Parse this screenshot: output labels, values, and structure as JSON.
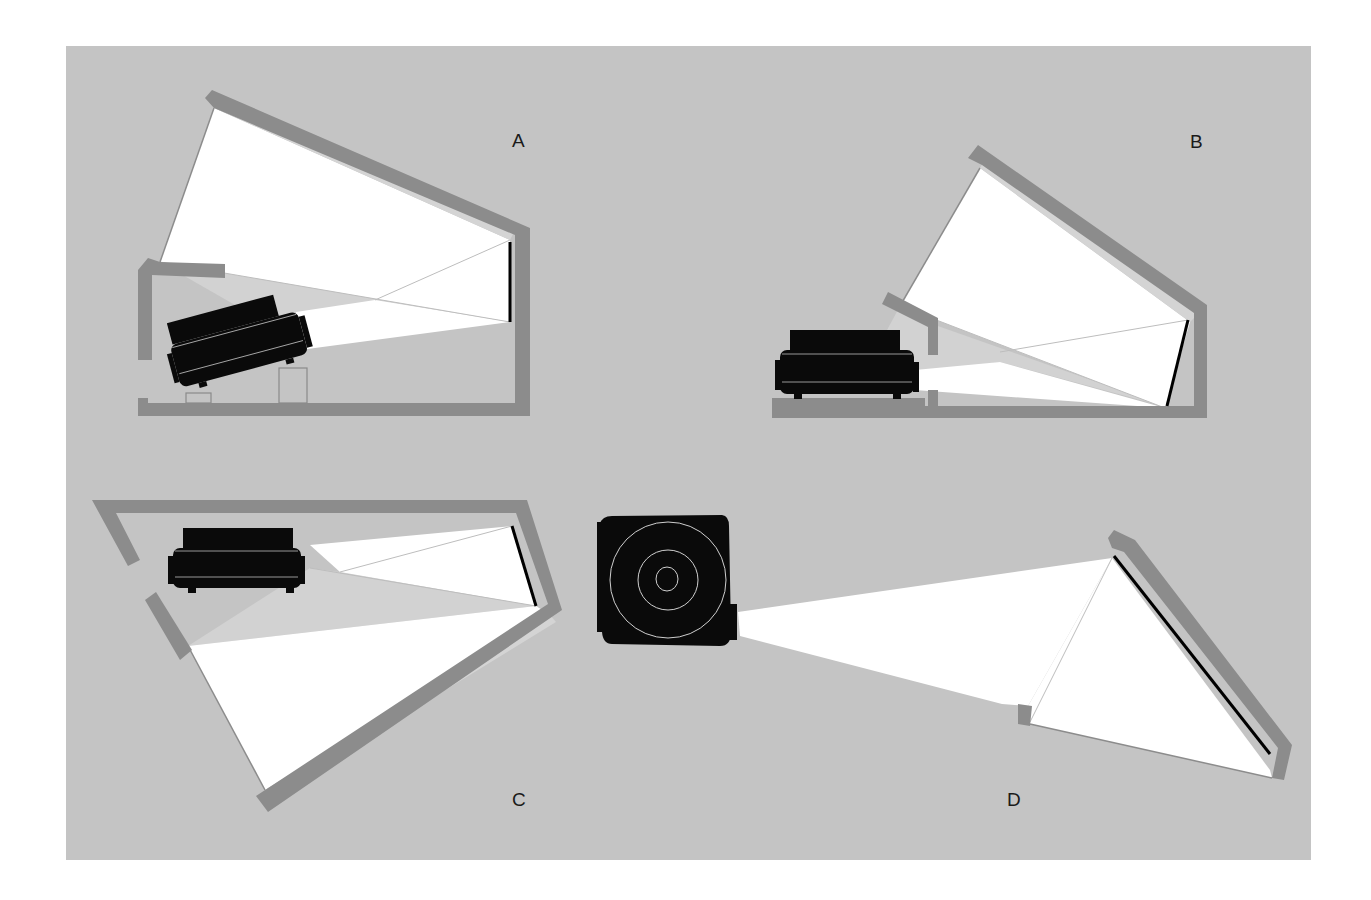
{
  "figure": {
    "type": "projector-placement-diagram",
    "colors": {
      "background": "#ffffff",
      "panel": "#c4c4c4",
      "wall": "#8c8c8c",
      "beam": "#ffffff",
      "shadow_beam": "#d2d2d2",
      "projector": "#0a0a0a",
      "screen": "#000000"
    },
    "configurations": [
      {
        "id": "A",
        "label": "A",
        "description": "Rear projection, projector tilted upward from floor, mirror in sloped ceiling, screen on right wall"
      },
      {
        "id": "B",
        "label": "B",
        "description": "Rear projection, projector on floor outside enclosure, mirror on sloped ceiling, tilted screen on right"
      },
      {
        "id": "C",
        "label": "C",
        "description": "Rear projection, projector near top, large angled mirror at bottom, screen at right"
      },
      {
        "id": "D",
        "label": "D",
        "description": "Top view, projector seen from front, beam reflected off angled wall mirror onto screen"
      }
    ]
  }
}
